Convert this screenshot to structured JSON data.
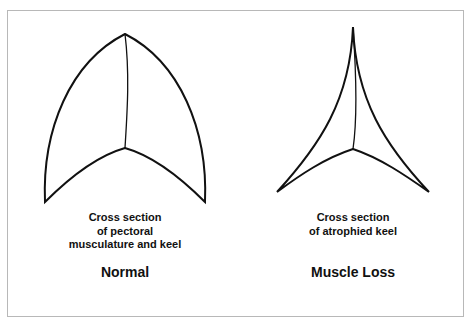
{
  "figure": {
    "panels": [
      {
        "id": "normal",
        "caption_lines": [
          "Cross section",
          "of pectoral",
          "musculature and keel"
        ],
        "title": "Normal"
      },
      {
        "id": "muscle-loss",
        "caption_lines": [
          "Cross section",
          "of atrophied keel"
        ],
        "title": "Muscle Loss"
      }
    ],
    "colors": {
      "stroke": "#111111",
      "border": "#b8b8b8",
      "background": "#ffffff"
    }
  }
}
